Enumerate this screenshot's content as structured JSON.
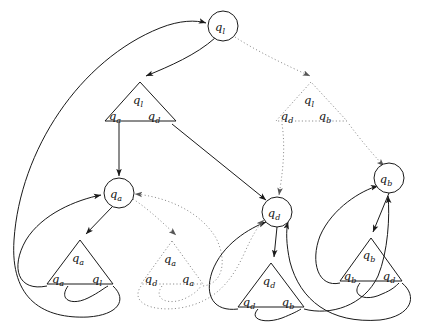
{
  "diagram": {
    "type": "directed-graph",
    "stroke_solid": "#1a1a1a",
    "stroke_dotted": "#9a9a9a",
    "background": "#ffffff",
    "canvas": {
      "width": 426,
      "height": 327
    },
    "state_nodes": [
      {
        "id": "n_ql",
        "label": "q",
        "sub": "l",
        "shape": "circle",
        "cx": 223,
        "cy": 26,
        "r": 15,
        "style": "solid"
      },
      {
        "id": "n_qa",
        "label": "q",
        "sub": "a",
        "shape": "circle",
        "cx": 119,
        "cy": 193,
        "r": 15,
        "style": "solid"
      },
      {
        "id": "n_qd",
        "label": "q",
        "sub": "d",
        "shape": "circle",
        "cx": 277,
        "cy": 212,
        "r": 15,
        "style": "solid"
      },
      {
        "id": "n_qb",
        "label": "q",
        "sub": "b",
        "shape": "circle",
        "cx": 389,
        "cy": 178,
        "r": 15,
        "style": "solid"
      }
    ],
    "rule_nodes": [
      {
        "id": "t_l_ad",
        "style": "solid",
        "apex": "q",
        "apex_sub": "l",
        "left": "q",
        "left_sub": "a",
        "right": "q",
        "right_sub": "d",
        "ax": 140,
        "ay": 82,
        "bx": 105,
        "by": 121,
        "cx": 176,
        "cy": 121
      },
      {
        "id": "t_l_db",
        "style": "dotted",
        "apex": "q",
        "apex_sub": "l",
        "left": "q",
        "left_sub": "d",
        "right": "q",
        "right_sub": "b",
        "ax": 311,
        "ay": 82,
        "bx": 276,
        "by": 121,
        "cx": 347,
        "cy": 121
      },
      {
        "id": "t_a_al",
        "style": "solid",
        "apex": "q",
        "apex_sub": "a",
        "left": "q",
        "left_sub": "a",
        "right": "q",
        "right_sub": "l",
        "ax": 80,
        "ay": 240,
        "bx": 47,
        "by": 284,
        "cx": 113,
        "cy": 284
      },
      {
        "id": "t_a_da",
        "style": "dotted",
        "apex": "q",
        "apex_sub": "a",
        "left": "q",
        "left_sub": "d",
        "right": "q",
        "right_sub": "a",
        "ax": 172,
        "ay": 241,
        "bx": 141,
        "by": 284,
        "cx": 203,
        "cy": 284
      },
      {
        "id": "t_d_db",
        "style": "solid",
        "apex": "q",
        "apex_sub": "d",
        "left": "q",
        "left_sub": "d",
        "right": "q",
        "right_sub": "b",
        "ax": 271,
        "ay": 263,
        "bx": 238,
        "by": 307,
        "cx": 304,
        "cy": 307
      },
      {
        "id": "t_b_bd",
        "style": "solid",
        "apex": "q",
        "apex_sub": "b",
        "left": "q",
        "left_sub": "b",
        "right": "q",
        "right_sub": "d",
        "ax": 371,
        "ay": 238,
        "bx": 340,
        "by": 281,
        "cx": 402,
        "cy": 281
      }
    ],
    "edges": [
      {
        "id": "e1",
        "from": "n_ql",
        "to": "t_l_ad",
        "style": "solid"
      },
      {
        "id": "e2",
        "from": "n_ql",
        "to": "t_l_db",
        "style": "dotted"
      },
      {
        "id": "e3",
        "from": "t_l_ad_left",
        "to": "n_qa",
        "style": "solid"
      },
      {
        "id": "e4",
        "from": "t_l_ad_right",
        "to": "n_qd",
        "style": "solid"
      },
      {
        "id": "e5",
        "from": "t_l_db_left",
        "to": "n_qd",
        "style": "dotted"
      },
      {
        "id": "e6",
        "from": "t_l_db_right",
        "to": "n_qb",
        "style": "dotted"
      },
      {
        "id": "e7",
        "from": "n_qa",
        "to": "t_a_al",
        "style": "solid"
      },
      {
        "id": "e8",
        "from": "n_qa",
        "to": "t_a_da",
        "style": "dotted"
      },
      {
        "id": "e9",
        "from": "t_a_al_left",
        "to": "n_qa",
        "style": "solid"
      },
      {
        "id": "e10",
        "from": "t_a_al_right",
        "to": "n_ql",
        "style": "solid"
      },
      {
        "id": "e11",
        "from": "t_a_da_left",
        "to": "n_qd",
        "style": "dotted"
      },
      {
        "id": "e12",
        "from": "t_a_da_right",
        "to": "n_qa",
        "style": "dotted"
      },
      {
        "id": "e13",
        "from": "n_qd",
        "to": "t_d_db",
        "style": "solid"
      },
      {
        "id": "e14",
        "from": "t_d_db_left",
        "to": "n_qd",
        "style": "solid"
      },
      {
        "id": "e15",
        "from": "t_d_db_right",
        "to": "n_qb",
        "style": "solid"
      },
      {
        "id": "e16",
        "from": "n_qb",
        "to": "t_b_bd",
        "style": "solid"
      },
      {
        "id": "e17",
        "from": "t_b_bd_left",
        "to": "n_qb",
        "style": "solid"
      },
      {
        "id": "e18",
        "from": "t_b_bd_right",
        "to": "n_qd",
        "style": "solid"
      }
    ]
  }
}
